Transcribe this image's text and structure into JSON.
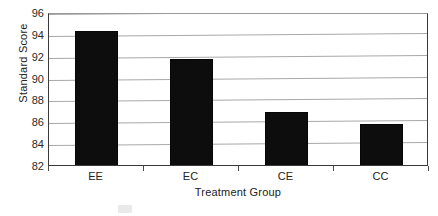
{
  "chart_data": {
    "type": "bar",
    "title": "",
    "subtitle": "",
    "xlabel": "Treatment Group",
    "ylabel": "Standard Score",
    "categories": [
      "EE",
      "EC",
      "CE",
      "CC"
    ],
    "values": [
      94.4,
      91.9,
      87.0,
      85.9
    ],
    "series": [
      {
        "name": "Standard Score",
        "values": [
          94.4,
          91.9,
          87.0,
          85.9
        ],
        "color": "#0d0d0d"
      }
    ],
    "ylim": [
      82,
      96
    ],
    "yticks": [
      82,
      84,
      86,
      88,
      90,
      92,
      94,
      96
    ],
    "ytick_labels": [
      "82",
      "84",
      "86",
      "88",
      "90",
      "92",
      "94",
      "96"
    ],
    "xtick_labels": [
      "EE",
      "EC",
      "CE",
      "CC"
    ],
    "grid": true,
    "grid_axis": "y",
    "legend": false,
    "legend_position": "none",
    "bar_color": "#0d0d0d",
    "gridline_color": "#a8a8a8",
    "axis_color": "#3a3a3a",
    "background_color": "#ffffff",
    "annotations": []
  }
}
